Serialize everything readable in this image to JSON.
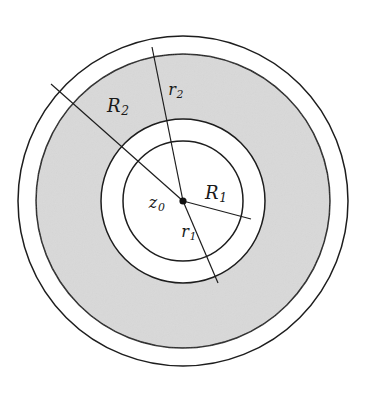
{
  "figure": {
    "kind": "annulus-radii-diagram",
    "background_color": "#ffffff",
    "stroke_color": "#1d1d1d",
    "shaded_fill": "#d9d9d9",
    "unshaded_fill": "#ffffff",
    "center_dot_color": "#111111",
    "center": {
      "x": 183,
      "y": 201
    },
    "circles": [
      {
        "name": "outer-boundary-circle",
        "radius": 165,
        "fill": "#ffffff",
        "stroke": "#1d1d1d"
      },
      {
        "name": "shaded-annulus-outer-circle",
        "radius": 147,
        "fill": "#d9d9d9",
        "stroke": "#1d1d1d"
      },
      {
        "name": "middle-circle",
        "radius": 82,
        "fill": "#ffffff",
        "stroke": "#1d1d1d"
      },
      {
        "name": "inner-circle",
        "radius": 60,
        "fill": "#ffffff",
        "stroke": "#1d1d1d"
      }
    ],
    "radius_lines": [
      {
        "name": "R2-radius-line",
        "x1": 183,
        "y1": 201,
        "x2": 51,
        "y2": 84
      },
      {
        "name": "R1-radius-line",
        "x1": 183,
        "y1": 201,
        "x2": 251,
        "y2": 219
      },
      {
        "name": "r2-radius-line",
        "x1": 183,
        "y1": 201,
        "x2": 152,
        "y2": 47
      },
      {
        "name": "r1-radius-line",
        "x1": 183,
        "y1": 201,
        "x2": 218,
        "y2": 283
      }
    ],
    "center_dot_radius": 3.6
  },
  "labels": {
    "R2": {
      "base": "R",
      "sub": "2",
      "x": 118,
      "y": 107
    },
    "r2": {
      "base": "r",
      "sub": "2",
      "x": 176,
      "y": 91
    },
    "R1": {
      "base": "R",
      "sub": "1",
      "x": 216,
      "y": 194
    },
    "z0": {
      "base": "z",
      "sub": "0",
      "x": 157,
      "y": 204
    },
    "r1": {
      "base": "r",
      "sub": "1",
      "x": 189,
      "y": 233
    }
  }
}
